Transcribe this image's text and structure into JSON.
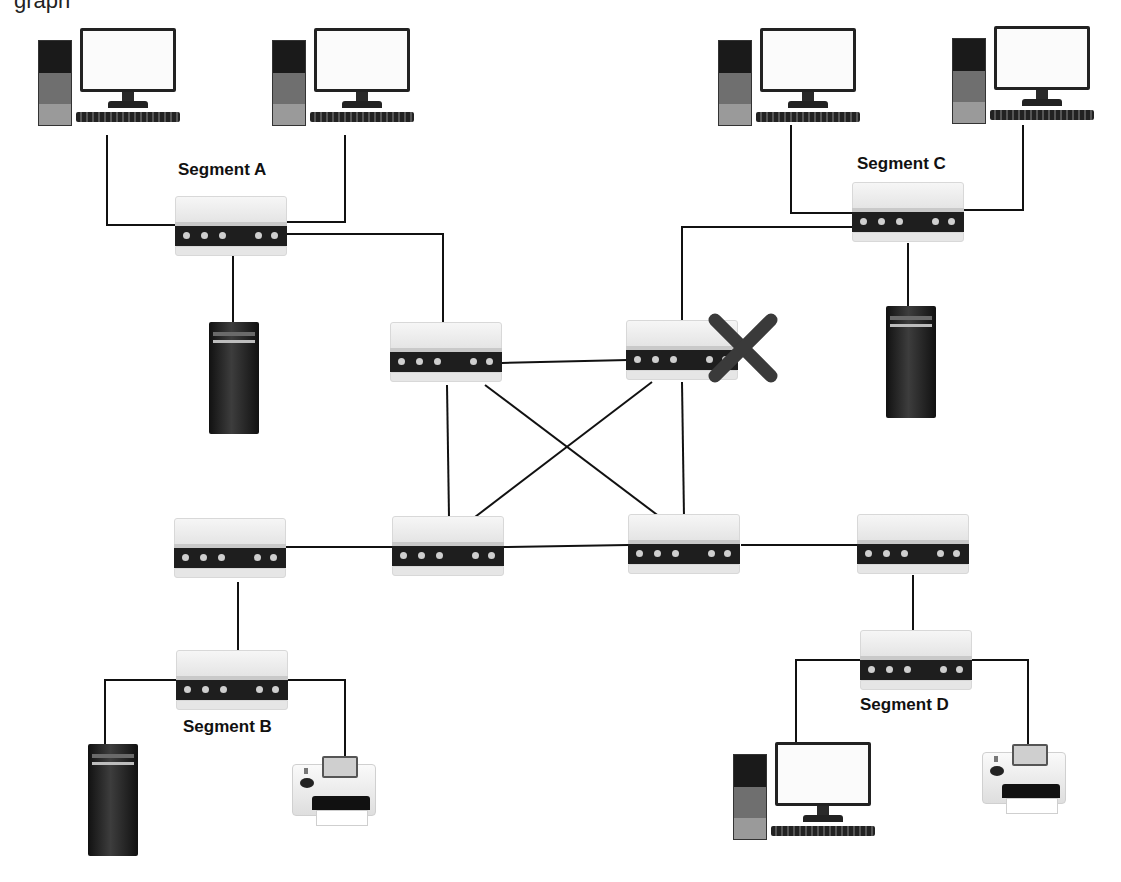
{
  "diagram": {
    "partial_caption": "graph",
    "labels": {
      "segment_a": "Segment A",
      "segment_b": "Segment B",
      "segment_c": "Segment C",
      "segment_d": "Segment D"
    },
    "failed_device_marker": "x-mark",
    "colors": {
      "line": "#111111",
      "failure_mark": "#3a3a3a",
      "hub_panel": "#1e1e1e",
      "background": "#ffffff"
    },
    "nodes": [
      {
        "id": "pc-a1",
        "type": "desktop",
        "segment": "A"
      },
      {
        "id": "pc-a2",
        "type": "desktop",
        "segment": "A"
      },
      {
        "id": "hub-a",
        "type": "hub",
        "segment": "A"
      },
      {
        "id": "server-a",
        "type": "server",
        "segment": "A"
      },
      {
        "id": "pc-c1",
        "type": "desktop",
        "segment": "C"
      },
      {
        "id": "pc-c2",
        "type": "desktop",
        "segment": "C"
      },
      {
        "id": "hub-c",
        "type": "hub",
        "segment": "C"
      },
      {
        "id": "server-c",
        "type": "server",
        "segment": "C"
      },
      {
        "id": "core-tl",
        "type": "switch",
        "segment": "core"
      },
      {
        "id": "core-tr",
        "type": "switch",
        "segment": "core",
        "status": "failed"
      },
      {
        "id": "core-bl",
        "type": "switch",
        "segment": "core"
      },
      {
        "id": "core-br",
        "type": "switch",
        "segment": "core"
      },
      {
        "id": "hub-bl-edge",
        "type": "switch",
        "segment": "B"
      },
      {
        "id": "hub-b",
        "type": "hub",
        "segment": "B"
      },
      {
        "id": "server-b",
        "type": "server",
        "segment": "B"
      },
      {
        "id": "printer-b",
        "type": "printer",
        "segment": "B"
      },
      {
        "id": "hub-br-edge",
        "type": "switch",
        "segment": "D"
      },
      {
        "id": "hub-d",
        "type": "hub",
        "segment": "D"
      },
      {
        "id": "pc-d1",
        "type": "desktop",
        "segment": "D"
      },
      {
        "id": "printer-d",
        "type": "printer",
        "segment": "D"
      }
    ],
    "links": [
      [
        "pc-a1",
        "hub-a"
      ],
      [
        "pc-a2",
        "hub-a"
      ],
      [
        "hub-a",
        "server-a"
      ],
      [
        "hub-a",
        "core-tl"
      ],
      [
        "pc-c1",
        "hub-c"
      ],
      [
        "pc-c2",
        "hub-c"
      ],
      [
        "hub-c",
        "server-c"
      ],
      [
        "hub-c",
        "core-tr"
      ],
      [
        "core-tl",
        "core-tr"
      ],
      [
        "core-tl",
        "core-bl"
      ],
      [
        "core-tl",
        "core-br"
      ],
      [
        "core-tr",
        "core-bl"
      ],
      [
        "core-tr",
        "core-br"
      ],
      [
        "core-bl",
        "core-br"
      ],
      [
        "hub-bl-edge",
        "core-bl"
      ],
      [
        "hub-bl-edge",
        "hub-b"
      ],
      [
        "hub-b",
        "server-b"
      ],
      [
        "hub-b",
        "printer-b"
      ],
      [
        "core-br",
        "hub-br-edge"
      ],
      [
        "hub-br-edge",
        "hub-d"
      ],
      [
        "hub-d",
        "pc-d1"
      ],
      [
        "hub-d",
        "printer-d"
      ]
    ]
  }
}
